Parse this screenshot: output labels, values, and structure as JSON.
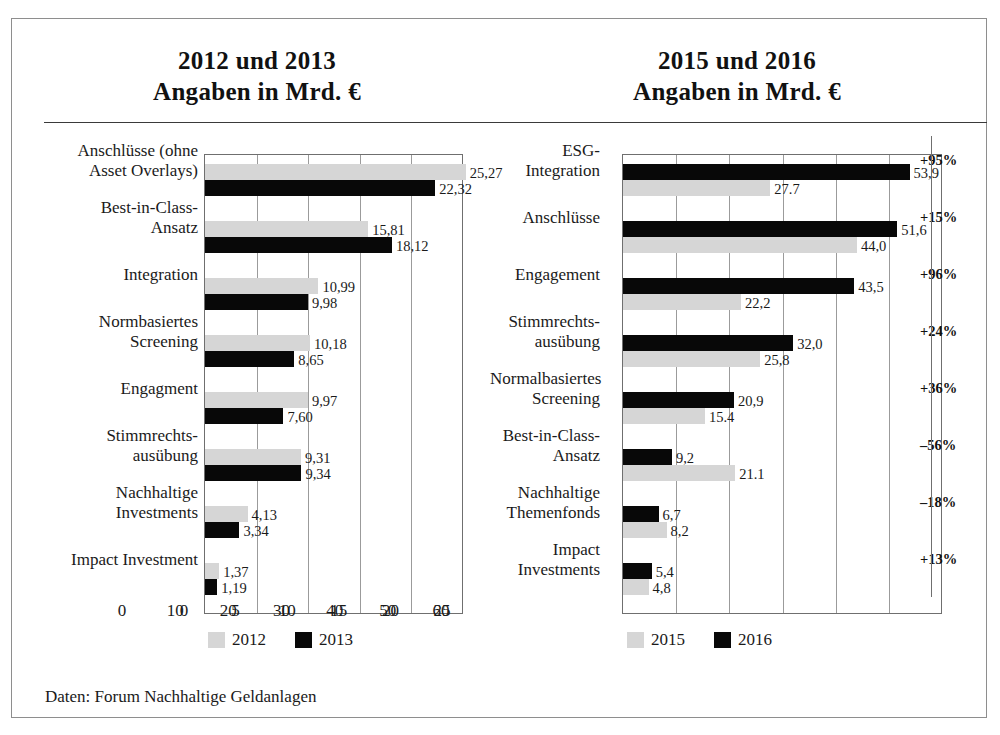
{
  "figure": {
    "source_note": "Daten: Forum Nachhaltige Geldanlagen"
  },
  "left": {
    "title_line1": "2012 und 2013",
    "title_line2": "Angaben in Mrd. €",
    "legend": [
      {
        "label": "2012",
        "color": "#d6d6d6"
      },
      {
        "label": "2013",
        "color": "#080808"
      }
    ]
  },
  "right": {
    "title_line1": "2015 und 2016",
    "title_line2": "Angaben in Mrd. €",
    "legend": [
      {
        "label": "2015",
        "color": "#d6d6d6"
      },
      {
        "label": "2016",
        "color": "#080808"
      }
    ]
  },
  "chart_data": [
    {
      "type": "bar",
      "orientation": "horizontal",
      "title": "2012 und 2013 — Angaben in Mrd. €",
      "xlabel": "",
      "ylabel": "",
      "xlim": [
        0,
        25
      ],
      "xticks": [
        "0",
        "5",
        "10",
        "15",
        "20",
        "25"
      ],
      "xtick_values": [
        0,
        5,
        10,
        15,
        20,
        25
      ],
      "grid": true,
      "legend_position": "bottom-left",
      "categories": [
        "Anschlüsse (ohne Asset Overlays)",
        "Best-in-Class-Ansatz",
        "Integration",
        "Normbasiertes Screening",
        "Engagment",
        "Stimmrechts-ausübung",
        "Nachhaltige Investments",
        "Impact Investment"
      ],
      "category_lines": [
        [
          "Anschlüsse (ohne",
          "Asset Overlays)"
        ],
        [
          "Best-in-Class-",
          "Ansatz"
        ],
        [
          "Integration"
        ],
        [
          "Normbasiertes",
          "Screening"
        ],
        [
          "Engagment"
        ],
        [
          "Stimmrechts-",
          "ausübung"
        ],
        [
          "Nachhaltige",
          "Investments"
        ],
        [
          "Impact Investment"
        ]
      ],
      "series": [
        {
          "name": "2012",
          "color": "#d6d6d6",
          "values": [
            25.27,
            15.81,
            10.99,
            10.18,
            9.97,
            9.31,
            4.13,
            1.37
          ],
          "labels": [
            "25,27",
            "15,81",
            "10,99",
            "10,18",
            "9,97",
            "9,31",
            "4,13",
            "1,37"
          ]
        },
        {
          "name": "2013",
          "color": "#080808",
          "values": [
            22.32,
            18.12,
            9.98,
            8.65,
            7.6,
            9.34,
            3.34,
            1.19
          ],
          "labels": [
            "22,32",
            "18,12",
            "9,98",
            "8,65",
            "7,60",
            "9,34",
            "3,34",
            "1,19"
          ]
        }
      ]
    },
    {
      "type": "bar",
      "orientation": "horizontal",
      "title": "2015 und 2016 — Angaben in Mrd. €",
      "xlabel": "",
      "ylabel": "",
      "xlim": [
        0,
        60
      ],
      "xticks": [
        "0",
        "10",
        "20",
        "30",
        "40",
        "50",
        "60"
      ],
      "xtick_values": [
        0,
        10,
        20,
        30,
        40,
        50,
        60
      ],
      "grid": true,
      "legend_position": "bottom-left",
      "categories": [
        "ESG-Integration",
        "Anschlüsse",
        "Engagement",
        "Stimmrechts-ausübung",
        "Normalbasiertes Screening",
        "Best-in-Class-Ansatz",
        "Nachhaltige Themenfonds",
        "Impact Investments"
      ],
      "category_lines": [
        [
          "ESG-",
          "Integration"
        ],
        [
          "Anschlüsse"
        ],
        [
          "Engagement"
        ],
        [
          "Stimmrechts-",
          "ausübung"
        ],
        [
          "Normalbasiertes",
          "Screening"
        ],
        [
          "Best-in-Class-",
          "Ansatz"
        ],
        [
          "Nachhaltige",
          "Themenfonds"
        ],
        [
          "Impact",
          "Investments"
        ]
      ],
      "series": [
        {
          "name": "2016",
          "color": "#080808",
          "values": [
            53.9,
            51.6,
            43.5,
            32.0,
            20.9,
            9.2,
            6.7,
            5.4
          ],
          "labels": [
            "53,9",
            "51,6",
            "43,5",
            "32,0",
            "20,9",
            "9,2",
            "6,7",
            "5,4"
          ]
        },
        {
          "name": "2015",
          "color": "#d6d6d6",
          "values": [
            27.7,
            44.0,
            22.2,
            25.8,
            15.4,
            21.1,
            8.2,
            4.8
          ],
          "labels": [
            "27.7",
            "44,0",
            "22,2",
            "25,8",
            "15.4",
            "21.1",
            "8,2",
            "4,8"
          ]
        }
      ],
      "annotations": {
        "name": "change",
        "values": [
          "+95%",
          "+15%",
          "+96%",
          "+24%",
          "+36%",
          "–56%",
          "–18%",
          "+13%"
        ]
      }
    }
  ]
}
